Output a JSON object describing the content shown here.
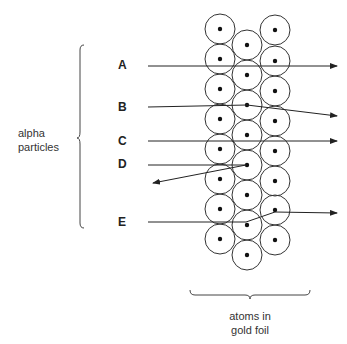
{
  "diagram": {
    "group_label": {
      "line1": "alpha",
      "line2": "particles"
    },
    "foil_label": {
      "line1": "atoms in",
      "line2": "gold foil"
    },
    "particles": [
      {
        "label": "A",
        "behavior": "passes straight through"
      },
      {
        "label": "B",
        "behavior": "slightly deflected downward"
      },
      {
        "label": "C",
        "behavior": "passes straight through"
      },
      {
        "label": "D",
        "behavior": "reflected back"
      },
      {
        "label": "E",
        "behavior": "deflected upward"
      }
    ],
    "atoms": {
      "columns": 3,
      "left_column_count": 8,
      "middle_column_count": 8,
      "right_column_count": 8,
      "icon": "atom-with-nucleus"
    },
    "colors": {
      "line": "#222222",
      "circle": "#333333",
      "text": "#333333",
      "background": "#ffffff"
    }
  }
}
